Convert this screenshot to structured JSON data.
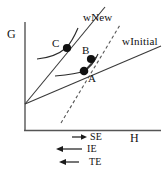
{
  "figure": {
    "type": "economics-indifference-curve-diagram",
    "axes": {
      "y_label": "G",
      "x_label": "H",
      "y_axis_x": 25,
      "x_axis_y": 130,
      "origin": [
        25,
        104
      ]
    },
    "budget_lines": [
      {
        "name": "wInitial",
        "label": "wInitial",
        "style": "solid",
        "from": [
          25,
          104
        ],
        "to": [
          160,
          47
        ],
        "label_pos": [
          124,
          38
        ]
      },
      {
        "name": "wNew",
        "label": "wNew",
        "style": "solid",
        "from": [
          25,
          104
        ],
        "to": [
          104,
          8
        ],
        "label_pos": [
          84,
          14
        ]
      },
      {
        "name": "compensated",
        "label": "",
        "style": "dashed",
        "from": [
          62,
          122
        ],
        "to": [
          119,
          26
        ],
        "label_pos": [
          0,
          0
        ]
      }
    ],
    "indifference_curves": [
      {
        "name": "U-new",
        "through": "C"
      },
      {
        "name": "U-initial",
        "through": "A"
      }
    ],
    "points": [
      {
        "id": "A",
        "label": "A",
        "x": 84,
        "y": 71,
        "label_x": 88,
        "label_y": 75
      },
      {
        "id": "B",
        "label": "B",
        "x": 91,
        "y": 59,
        "label_x": 83,
        "label_y": 47
      },
      {
        "id": "C",
        "label": "C",
        "x": 67,
        "y": 48,
        "label_x": 53,
        "label_y": 40
      }
    ],
    "effects": [
      {
        "id": "SE",
        "label": "SE",
        "direction": "right",
        "arrow_x1": 72,
        "arrow_x2": 86,
        "y": 137,
        "label_x": 90
      },
      {
        "id": "IE",
        "label": "IE",
        "direction": "left",
        "arrow_x1": 57,
        "arrow_x2": 82,
        "y": 149,
        "label_x": 87
      },
      {
        "id": "TE",
        "label": "TE",
        "direction": "left",
        "arrow_x1": 60,
        "arrow_x2": 79,
        "y": 162,
        "label_x": 90
      }
    ],
    "colors": {
      "ink": "#111111",
      "line": "#333333",
      "background": "#ffffff"
    }
  }
}
